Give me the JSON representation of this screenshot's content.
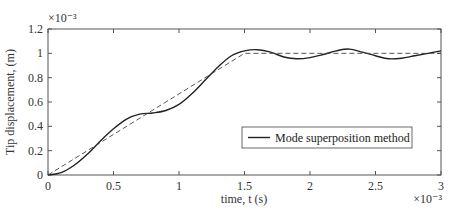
{
  "chart_data": {
    "type": "line",
    "title": "",
    "xlabel": "time, t (s)",
    "ylabel": "Tip displacement, (m)",
    "x_multiplier": "×10⁻³",
    "y_multiplier": "×10⁻³",
    "xlim": [
      0,
      3
    ],
    "ylim": [
      0,
      1.2
    ],
    "xticks": [
      0,
      0.5,
      1,
      1.5,
      2,
      2.5,
      3
    ],
    "xtick_labels": [
      "0",
      "0.5",
      "1",
      "1.5",
      "2",
      "2.5",
      "3"
    ],
    "yticks": [
      0,
      0.2,
      0.4,
      0.6,
      0.8,
      1.0,
      1.2
    ],
    "ytick_labels": [
      "0",
      "0.2",
      "0.4",
      "0.6",
      "0.8",
      "1",
      "1.2"
    ],
    "grid": false,
    "legend_position": "center-right",
    "series": [
      {
        "name": "Mode superposition method",
        "style": "solid",
        "color": "#222222",
        "x": [
          0,
          0.1,
          0.2,
          0.3,
          0.4,
          0.5,
          0.6,
          0.7,
          0.8,
          0.9,
          1.0,
          1.1,
          1.2,
          1.3,
          1.4,
          1.5,
          1.6,
          1.7,
          1.8,
          1.9,
          2.0,
          2.1,
          2.2,
          2.3,
          2.4,
          2.5,
          2.6,
          2.7,
          2.8,
          2.9,
          3.0
        ],
        "y": [
          0,
          0.02,
          0.08,
          0.17,
          0.28,
          0.38,
          0.46,
          0.5,
          0.51,
          0.53,
          0.58,
          0.67,
          0.78,
          0.89,
          0.98,
          1.02,
          1.03,
          1.01,
          0.97,
          0.955,
          0.965,
          0.99,
          1.02,
          1.035,
          1.01,
          0.98,
          0.955,
          0.96,
          0.98,
          1.0,
          1.02
        ]
      },
      {
        "name": "Reference (dashed)",
        "style": "dashed",
        "color": "#444444",
        "x": [
          0,
          1.5,
          3.0
        ],
        "y": [
          0,
          1.0,
          1.0
        ]
      }
    ]
  },
  "legend": {
    "entries": [
      "Mode superposition method"
    ]
  }
}
